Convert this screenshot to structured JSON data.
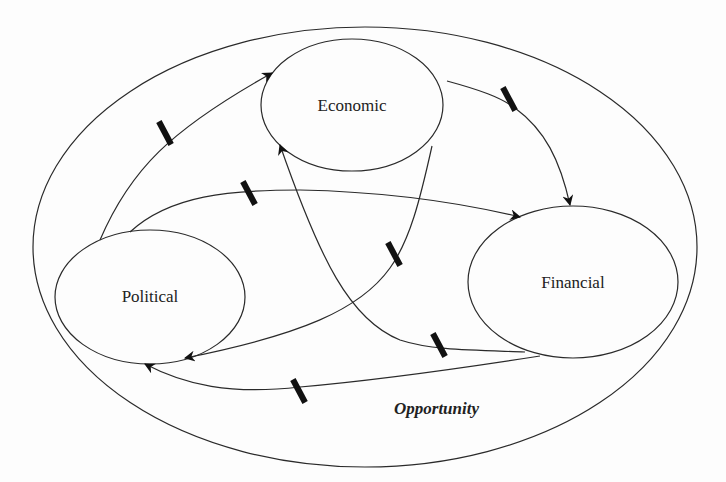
{
  "diagram": {
    "context": {
      "label": "Opportunity"
    },
    "nodes": [
      {
        "id": "economic",
        "label": "Economic"
      },
      {
        "id": "political",
        "label": "Political"
      },
      {
        "id": "financial",
        "label": "Financial"
      }
    ],
    "edges": [
      {
        "from": "political",
        "to": "economic",
        "delay": true
      },
      {
        "from": "political",
        "to": "financial",
        "delay": true
      },
      {
        "from": "economic",
        "to": "financial",
        "delay": true
      },
      {
        "from": "economic",
        "to": "political",
        "delay": true
      },
      {
        "from": "financial",
        "to": "economic",
        "delay": true
      },
      {
        "from": "financial",
        "to": "political",
        "delay": true
      }
    ],
    "colors": {
      "stroke": "#2a2a2a",
      "background": "#fdfdfd"
    }
  }
}
